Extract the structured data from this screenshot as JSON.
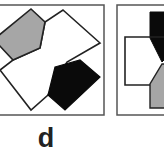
{
  "figure": {
    "panels": [
      {
        "id": "panel-1",
        "frame": {
          "x": -2,
          "y": 5,
          "w": 106,
          "h": 110
        },
        "outline_polygon": "63,10 100,43 67,62 48,95 31,110 0,70 13,60 40,48 45,22",
        "gray_polygon": "31,9 45,22 40,48 13,60 0,42 0,38",
        "black_polygon": "55,67 80,60 100,77 65,110 48,95"
      },
      {
        "id": "panel-2",
        "frame": {
          "x": 117,
          "y": 5,
          "w": 50,
          "h": 110
        },
        "inner_rect": {
          "x": 125,
          "y": 37,
          "w": 40,
          "h": 48
        },
        "black_polygon": "150,12 166,12 166,55 160,60 150,35",
        "gray_polygon": "160,62 166,62 166,108 150,108 150,82"
      }
    ],
    "label": "d",
    "colors": {
      "gray": "#a6a6a6",
      "black": "#0a0a0a",
      "line": "#222222",
      "frame": "#555555"
    }
  }
}
